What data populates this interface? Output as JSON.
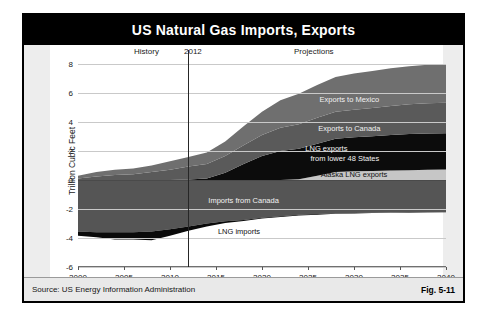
{
  "title": "US Natural Gas Imports, Exports",
  "footer": {
    "source": "Source:  US Energy Information Administration",
    "figure_number": "Fig. 5-11"
  },
  "annotations": {
    "history": "History",
    "divider_year": "2012",
    "projections": "Projections"
  },
  "series_labels": {
    "exports_mexico": "Exports to Mexico",
    "exports_canada": "Exports to Canada",
    "lng_exports_line1": "LNG exports",
    "lng_exports_line2": "from lower 48 States",
    "alaska_lng": "Alaska LNG exports",
    "imports_canada": "Imports  from Canada",
    "lng_imports": "LNG imports"
  },
  "colors": {
    "title_bar": "#000000",
    "exports_mexico": "#6f6f6f",
    "exports_canada": "#5a5a5a",
    "lng_exports": "#0c0c0c",
    "alaska_lng": "#c6c6c6",
    "imports_canada": "#555555",
    "lng_imports": "#0a0a0a",
    "panel_band": "#ededed",
    "footer_bg": "#e9e9e9"
  },
  "chart_data": {
    "type": "area",
    "title": "US Natural Gas Imports, Exports",
    "xlabel": "",
    "ylabel": "Trillion Cubic Feet",
    "xlim": [
      2000,
      2040
    ],
    "ylim": [
      -6,
      8
    ],
    "yticks": [
      8,
      6,
      4,
      2,
      0,
      -2,
      -4,
      -6
    ],
    "xticks": [
      2000,
      2005,
      2010,
      2015,
      2020,
      2025,
      2030,
      2035,
      2040
    ],
    "grid": true,
    "legend": "in-plot labels",
    "divider_x": 2012,
    "x": [
      2000,
      2002,
      2004,
      2006,
      2008,
      2010,
      2012,
      2014,
      2016,
      2018,
      2020,
      2022,
      2024,
      2026,
      2028,
      2030,
      2032,
      2034,
      2036,
      2038,
      2040
    ],
    "series": [
      {
        "name": "Alaska LNG exports",
        "stack": "exports",
        "order": 1,
        "values": [
          0,
          0,
          0,
          0,
          0,
          0,
          0,
          0,
          0,
          0,
          0,
          0,
          0.05,
          0.3,
          0.55,
          0.6,
          0.62,
          0.65,
          0.68,
          0.7,
          0.72
        ]
      },
      {
        "name": "LNG exports from lower 48 States",
        "stack": "exports",
        "order": 2,
        "values": [
          0,
          0,
          0,
          0,
          0,
          0,
          0.03,
          0.1,
          0.5,
          1.1,
          1.65,
          2.0,
          2.1,
          2.2,
          2.3,
          2.35,
          2.4,
          2.45,
          2.5,
          2.5,
          2.5
        ]
      },
      {
        "name": "Exports to Canada",
        "stack": "exports",
        "order": 3,
        "values": [
          0.1,
          0.25,
          0.35,
          0.4,
          0.55,
          0.7,
          0.9,
          1.0,
          1.15,
          1.3,
          1.45,
          1.6,
          1.7,
          1.8,
          1.85,
          1.9,
          1.95,
          2.0,
          2.05,
          2.1,
          2.1
        ]
      },
      {
        "name": "Exports to Mexico",
        "stack": "exports",
        "order": 4,
        "values": [
          0.2,
          0.3,
          0.35,
          0.4,
          0.45,
          0.6,
          0.65,
          0.8,
          1.0,
          1.3,
          1.6,
          1.9,
          2.1,
          2.25,
          2.4,
          2.5,
          2.55,
          2.6,
          2.62,
          2.65,
          2.68
        ]
      },
      {
        "name": "Imports from Canada",
        "stack": "imports",
        "order": 1,
        "values": [
          -3.55,
          -3.6,
          -3.6,
          -3.6,
          -3.55,
          -3.4,
          -3.2,
          -3.0,
          -2.85,
          -2.75,
          -2.6,
          -2.5,
          -2.4,
          -2.35,
          -2.3,
          -2.28,
          -2.25,
          -2.24,
          -2.23,
          -2.22,
          -2.2
        ]
      },
      {
        "name": "LNG imports",
        "stack": "imports",
        "order": 2,
        "values": [
          -0.3,
          -0.35,
          -0.5,
          -0.5,
          -0.6,
          -0.45,
          -0.3,
          -0.2,
          -0.12,
          -0.08,
          -0.06,
          -0.05,
          -0.04,
          -0.04,
          -0.03,
          -0.03,
          -0.03,
          -0.02,
          -0.02,
          -0.02,
          -0.02
        ]
      }
    ]
  }
}
